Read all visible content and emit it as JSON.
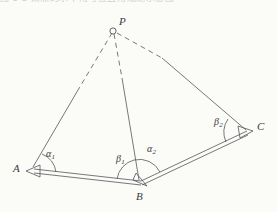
{
  "page": {
    "background_color": "#fbfbf8",
    "ink_color": "#3a3a40",
    "width": 277,
    "height": 212,
    "cropped_header_text": "图 5-2 某点的水平角与竖直角观测示意图"
  },
  "figure": {
    "type": "geometry-diagram",
    "vertices": [
      {
        "id": "P",
        "label": "P",
        "x": 113,
        "y": 30,
        "marker": "circle",
        "label_x": 120,
        "label_y": 17
      },
      {
        "id": "A",
        "label": "A",
        "x": 33,
        "y": 170,
        "marker": "arrowhead",
        "label_x": 13,
        "label_y": 163
      },
      {
        "id": "B",
        "label": "B",
        "x": 140,
        "y": 183,
        "marker": "arrowhead",
        "label_x": 136,
        "label_y": 190
      },
      {
        "id": "C",
        "label": "C",
        "x": 248,
        "y": 132,
        "marker": "arrowhead",
        "label_x": 257,
        "label_y": 120
      }
    ],
    "sight_lines": [
      {
        "id": "PA",
        "from": "P",
        "to": "A",
        "style": "dashed-near-P-then-solid"
      },
      {
        "id": "PB",
        "from": "P",
        "to": "B",
        "style": "dashed-near-P-then-solid"
      },
      {
        "id": "PC",
        "from": "P",
        "to": "C",
        "style": "dashed-near-P-then-solid"
      }
    ],
    "traverse_segments": [
      {
        "id": "AB",
        "from": "A",
        "to": "B",
        "style": "double-line"
      },
      {
        "id": "BC",
        "from": "B",
        "to": "C",
        "style": "double-line"
      }
    ],
    "angles": [
      {
        "id": "alpha1",
        "symbol": "α",
        "subscript": "1",
        "at_vertex": "A",
        "label_x": 47,
        "label_y": 150
      },
      {
        "id": "beta1",
        "symbol": "β",
        "subscript": "1",
        "at_vertex": "B",
        "label_x": 117,
        "label_y": 155
      },
      {
        "id": "alpha2",
        "symbol": "α",
        "subscript": "2",
        "at_vertex": "B",
        "label_x": 148,
        "label_y": 145
      },
      {
        "id": "beta2",
        "symbol": "β",
        "subscript": "2",
        "at_vertex": "C",
        "label_x": 215,
        "label_y": 118
      }
    ]
  }
}
